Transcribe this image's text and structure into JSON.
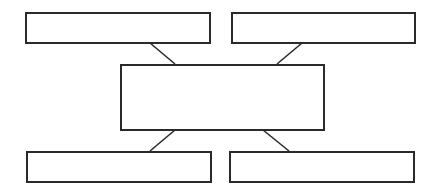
{
  "diagram": {
    "type": "hub-and-spoke",
    "stroke_color": "#2a2a2a",
    "background": "#ffffff",
    "center": {
      "label": "",
      "box": {
        "x": 120,
        "y": 64,
        "w": 205,
        "h": 67
      }
    },
    "nodes": [
      {
        "id": "top-left",
        "label": "",
        "box": {
          "x": 25,
          "y": 12,
          "w": 186,
          "h": 32
        }
      },
      {
        "id": "top-right",
        "label": "",
        "box": {
          "x": 231,
          "y": 12,
          "w": 185,
          "h": 32
        }
      },
      {
        "id": "bottom-left",
        "label": "",
        "box": {
          "x": 26,
          "y": 151,
          "w": 186,
          "h": 32
        }
      },
      {
        "id": "bottom-right",
        "label": "",
        "box": {
          "x": 229,
          "y": 151,
          "w": 186,
          "h": 32
        }
      }
    ],
    "edges": [
      {
        "from": "top-left",
        "to": "center",
        "x1": 150,
        "y1": 43,
        "x2": 175,
        "y2": 64
      },
      {
        "from": "top-right",
        "to": "center",
        "x1": 302,
        "y1": 43,
        "x2": 277,
        "y2": 64
      },
      {
        "from": "center",
        "to": "bottom-left",
        "x1": 175,
        "y1": 130,
        "x2": 150,
        "y2": 151
      },
      {
        "from": "center",
        "to": "bottom-right",
        "x1": 263,
        "y1": 130,
        "x2": 289,
        "y2": 151
      }
    ]
  }
}
